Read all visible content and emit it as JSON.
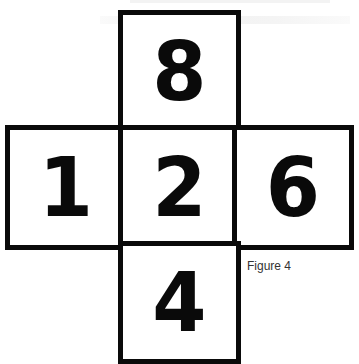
{
  "figure": {
    "caption": "Figure 4",
    "border_color": "#0a0a0a",
    "background_color": "#ffffff",
    "layout": "cross (unfolded cube net)",
    "cells": {
      "top": "8",
      "left": "1",
      "center": "2",
      "right": "6",
      "bottom": "4"
    }
  }
}
